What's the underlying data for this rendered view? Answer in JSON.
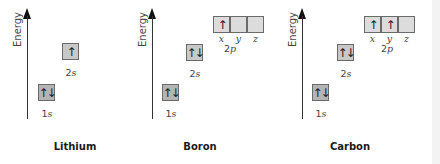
{
  "axis_label": "Energy",
  "arrows": {
    "up": "↑",
    "pair": "↑↓"
  },
  "colors": {
    "box_1s": "#b4b4b4",
    "box_2s": "#c8c8c8",
    "box_2p": "#dcdcdc",
    "border": "#6a6a6a"
  },
  "panels": [
    {
      "element": "Lithium",
      "orbitals": [
        {
          "name": "1s",
          "num": "1",
          "letter": "s",
          "electrons": "↑↓"
        },
        {
          "name": "2s",
          "num": "2",
          "letter": "s",
          "electrons": "↑"
        }
      ]
    },
    {
      "element": "Boron",
      "orbitals": [
        {
          "name": "1s",
          "num": "1",
          "letter": "s",
          "electrons": "↑↓"
        },
        {
          "name": "2s",
          "num": "2",
          "letter": "s",
          "electrons": "↑↓"
        },
        {
          "name": "2p",
          "num": "2",
          "letter": "p",
          "suborbitals": [
            {
              "label": "x",
              "electrons": "↑"
            },
            {
              "label": "y",
              "electrons": ""
            },
            {
              "label": "z",
              "electrons": ""
            }
          ]
        }
      ]
    },
    {
      "element": "Carbon",
      "orbitals": [
        {
          "name": "1s",
          "num": "1",
          "letter": "s",
          "electrons": "↑↓"
        },
        {
          "name": "2s",
          "num": "2",
          "letter": "s",
          "electrons": "↑↓"
        },
        {
          "name": "2p",
          "num": "2",
          "letter": "p",
          "suborbitals": [
            {
              "label": "x",
              "electrons": "↑"
            },
            {
              "label": "y",
              "electrons": "↑"
            },
            {
              "label": "z",
              "electrons": ""
            }
          ]
        }
      ]
    }
  ]
}
